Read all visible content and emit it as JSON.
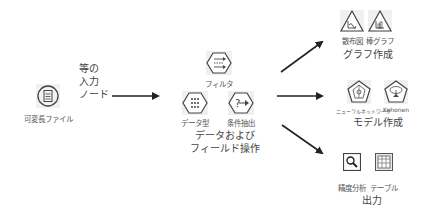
{
  "input": {
    "icon": "variable-file-icon",
    "label": "可変長ファイル",
    "group_label_lines": [
      "等の",
      "入力",
      "ノード"
    ]
  },
  "field_ops": {
    "nodes": [
      {
        "icon": "filter-icon",
        "label": "フィルタ"
      },
      {
        "icon": "type-icon",
        "label": "データ型"
      },
      {
        "icon": "select-icon",
        "label": "条件抽出"
      }
    ],
    "group_label_lines": [
      "データおよび",
      "フィールド操作"
    ]
  },
  "graphs": {
    "nodes": [
      {
        "icon": "plot-icon",
        "label": "散布図"
      },
      {
        "icon": "histogram-icon",
        "label": "棒グラフ"
      }
    ],
    "group_label": "グラフ作成"
  },
  "modeling": {
    "nodes": [
      {
        "icon": "neural-net-icon",
        "label": "ニューラルネットワーク"
      },
      {
        "icon": "kohonen-icon",
        "label": "Kohonen"
      }
    ],
    "group_label": "モデル作成"
  },
  "output": {
    "nodes": [
      {
        "icon": "analysis-icon",
        "label": "精度分析"
      },
      {
        "icon": "table-icon",
        "label": "テーブル"
      }
    ],
    "group_label": "出力"
  },
  "colors": {
    "arrow": "#222222",
    "icon_stroke": "#444444",
    "icon_bg": "#eeeeee",
    "text": "#555555"
  }
}
